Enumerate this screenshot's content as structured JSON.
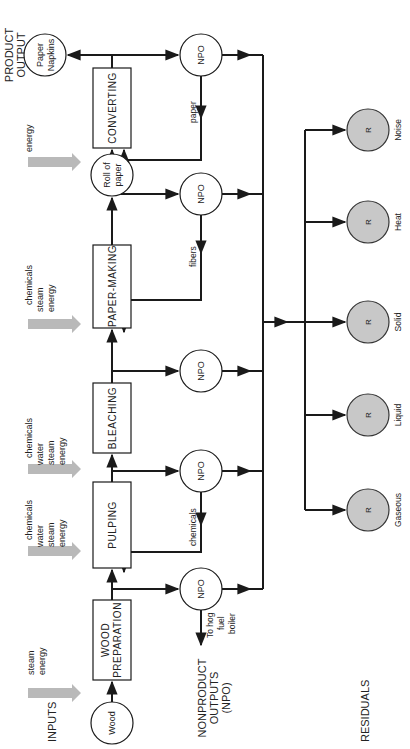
{
  "section_labels": {
    "inputs": "INPUTS",
    "nonproduct_line1": "NONPRODUCT",
    "nonproduct_line2": "OUTPUTS",
    "nonproduct_line3": "(NPO)",
    "residuals": "RESIDUALS",
    "product_line1": "PRODUCT",
    "product_line2": "OUTPUT"
  },
  "input_nodes": {
    "wood": "Wood",
    "roll_line1": "Roll of",
    "roll_line2": "paper",
    "napkins_line1": "Paper",
    "napkins_line2": "Napkins"
  },
  "processes": {
    "wood_prep_line1": "WOOD",
    "wood_prep_line2": "PREPARATION",
    "pulping": "PULPING",
    "bleaching": "BLEACHING",
    "paper_making": "PAPER-MAKING",
    "converting": "CONVERTING"
  },
  "inputs": {
    "wood_prep": [
      "steam",
      "energy"
    ],
    "pulping": [
      "chemicals",
      "water",
      "steam",
      "energy"
    ],
    "bleaching": [
      "chemicals",
      "water",
      "steam",
      "energy"
    ],
    "paper_making": [
      "chemicals",
      "steam",
      "energy"
    ],
    "converting": [
      "energy"
    ]
  },
  "npo": {
    "label": "NPO",
    "hog_line1": "To hog",
    "hog_line2": "fuel",
    "hog_line3": "boiler",
    "recycle_chemicals": "chemicals",
    "recycle_fibers": "fibers",
    "recycle_paper": "paper"
  },
  "residuals": {
    "label": "R",
    "items": [
      "Gaseous",
      "Liquid",
      "Solid",
      "Heat",
      "Noise"
    ]
  },
  "colors": {
    "line": "#1a1a1a",
    "input_arrow": "#b9b9b9",
    "residual_fill": "#c8c8c8"
  }
}
